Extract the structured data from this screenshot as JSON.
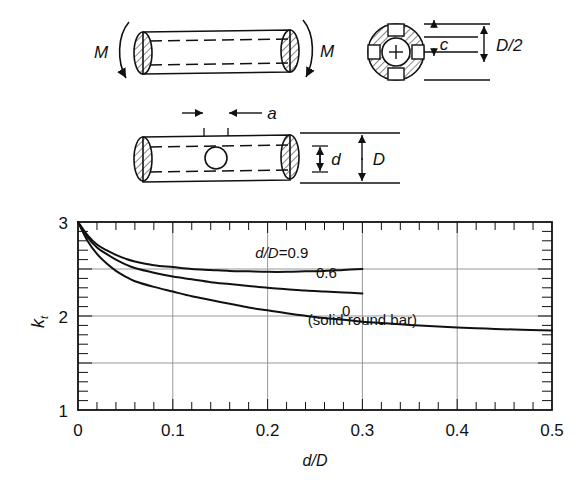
{
  "figure": {
    "title": "",
    "schematic": {
      "top_view": {
        "moment_label_left": "M",
        "moment_label_right": "M",
        "name": "round-shaft-in-bending"
      },
      "cross_section": {
        "dim_c": "c",
        "dim_half_diameter": "D/2",
        "center_mark": "+"
      },
      "hole_view": {
        "dim_a": "a",
        "dim_d": "d",
        "dim_D": "D"
      }
    }
  },
  "chart_data": {
    "type": "line",
    "title": "",
    "xlabel": "d/D",
    "ylabel": "k_t",
    "ylabel_base": "k",
    "ylabel_sub": "t",
    "xlim": [
      0,
      0.5
    ],
    "ylim": [
      1,
      3
    ],
    "grid": true,
    "x_major_ticks": [
      0,
      0.1,
      0.2,
      0.3,
      0.4,
      0.5
    ],
    "x_tick_labels": [
      "0",
      "0.1",
      "0.2",
      "0.3",
      "0.4",
      "0.5"
    ],
    "x_minor_step": 0.02,
    "y_major_ticks": [
      1,
      1.5,
      2,
      2.5,
      3
    ],
    "y_tick_labels": [
      "1",
      "",
      "2",
      "",
      "3"
    ],
    "y_labeled_ticks": [
      {
        "value": 3,
        "label": "3"
      },
      {
        "value": 2,
        "label": "2"
      },
      {
        "value": 1,
        "label": "1"
      }
    ],
    "y_minor_step": 0.1,
    "legend_position": "inline-on-curves",
    "annotations": [
      {
        "text": "d/D=0.9",
        "x": 0.215,
        "y": 2.62,
        "name": "curve-label-09"
      },
      {
        "text": "0.6",
        "x": 0.262,
        "y": 2.4,
        "name": "curve-label-06"
      },
      {
        "text": "0",
        "x": 0.283,
        "y": 2.0,
        "name": "curve-label-0"
      },
      {
        "text": "(solid round bar)",
        "x": 0.3,
        "y": 1.9,
        "name": "solid-round-bar-note"
      }
    ],
    "series": [
      {
        "name": "d/D=0.9",
        "label": "d/D=0.9",
        "x": [
          0,
          0.01,
          0.02,
          0.03,
          0.04,
          0.05,
          0.06,
          0.08,
          0.1,
          0.12,
          0.14,
          0.16,
          0.18,
          0.2,
          0.22,
          0.24,
          0.26,
          0.28,
          0.3
        ],
        "values": [
          3.0,
          2.86,
          2.76,
          2.7,
          2.65,
          2.61,
          2.58,
          2.54,
          2.52,
          2.5,
          2.49,
          2.48,
          2.475,
          2.47,
          2.47,
          2.475,
          2.48,
          2.49,
          2.5
        ]
      },
      {
        "name": "d/D=0.6",
        "label": "0.6",
        "x": [
          0,
          0.01,
          0.02,
          0.03,
          0.04,
          0.05,
          0.06,
          0.08,
          0.1,
          0.12,
          0.14,
          0.16,
          0.18,
          0.2,
          0.22,
          0.24,
          0.26,
          0.28,
          0.3
        ],
        "values": [
          3.0,
          2.84,
          2.73,
          2.66,
          2.6,
          2.55,
          2.51,
          2.46,
          2.42,
          2.39,
          2.36,
          2.34,
          2.32,
          2.3,
          2.285,
          2.27,
          2.26,
          2.25,
          2.24
        ]
      },
      {
        "name": "d/D=0 (solid round bar)",
        "label": "0",
        "x": [
          0,
          0.01,
          0.02,
          0.03,
          0.04,
          0.05,
          0.06,
          0.08,
          0.1,
          0.12,
          0.14,
          0.16,
          0.18,
          0.2,
          0.22,
          0.25,
          0.28,
          0.3,
          0.32,
          0.35,
          0.38,
          0.4,
          0.43,
          0.46,
          0.5
        ],
        "values": [
          3.0,
          2.8,
          2.66,
          2.56,
          2.48,
          2.42,
          2.37,
          2.31,
          2.26,
          2.21,
          2.17,
          2.13,
          2.09,
          2.06,
          2.03,
          1.99,
          1.96,
          1.94,
          1.925,
          1.905,
          1.888,
          1.878,
          1.866,
          1.856,
          1.845
        ]
      }
    ]
  }
}
